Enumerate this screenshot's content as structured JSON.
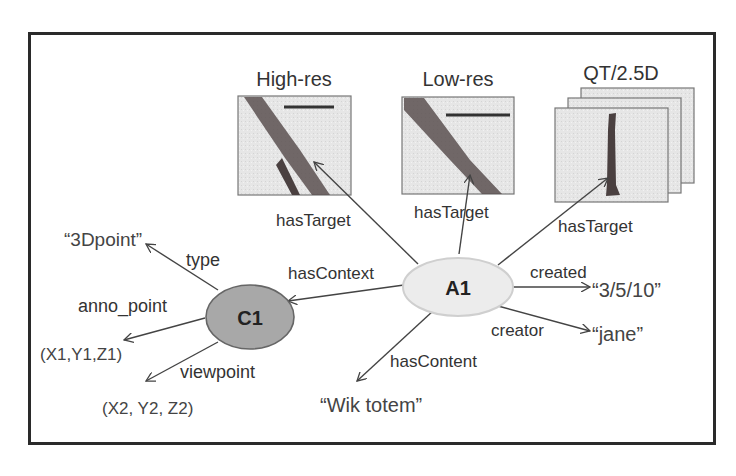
{
  "diagram": {
    "images": {
      "high_res": {
        "label": "High-res"
      },
      "low_res": {
        "label": "Low-res"
      },
      "qt": {
        "label": "QT/2.5D"
      }
    },
    "nodes": {
      "a1": {
        "label": "A1",
        "fill": "#ececec"
      },
      "c1": {
        "label": "C1",
        "fill": "#a8a8a8"
      }
    },
    "edges": {
      "has_target_1": "hasTarget",
      "has_target_2": "hasTarget",
      "has_target_3": "hasTarget",
      "has_context": "hasContext",
      "has_content": "hasContent",
      "created": "created",
      "creator": "creator",
      "type": "type",
      "anno_point": "anno_point",
      "viewpoint": "viewpoint"
    },
    "literals": {
      "date": "“3/5/10”",
      "jane": "“jane”",
      "wik_totem": "“Wik totem”",
      "three_d_point": "“3Dpoint”",
      "xyz1": "(X1,Y1,Z1)",
      "xyz2": "(X2, Y2, Z2)"
    }
  }
}
